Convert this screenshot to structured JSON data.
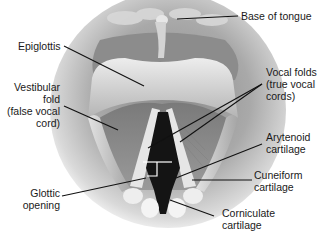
{
  "diagram": {
    "labels": [
      {
        "id": "base-of-tongue",
        "text": "Base of tongue"
      },
      {
        "id": "epiglottis",
        "text": "Epiglottis"
      },
      {
        "id": "vestibular-fold",
        "text": "Vestibular\nfold\n(false vocal\ncord)"
      },
      {
        "id": "vocal-folds",
        "text": "Vocal folds\n(true vocal\ncords)"
      },
      {
        "id": "arytenoid-cartilage",
        "text": "Arytenoid\ncartilage"
      },
      {
        "id": "cuneiform-cartilage",
        "text": "Cuneiform\ncartilage"
      },
      {
        "id": "glottic-opening",
        "text": "Glottic\nopening"
      },
      {
        "id": "corniculate-cartilage",
        "text": "Corniculate\ncartilage"
      }
    ],
    "colors": {
      "background": "#ffffff",
      "tissue_dark": "#6e6e6e",
      "tissue_mid": "#a8a8a8",
      "tissue_light": "#e6e6e6",
      "glottis": "#141414",
      "leader_line": "#111111",
      "text": "#1a1a1a"
    }
  }
}
